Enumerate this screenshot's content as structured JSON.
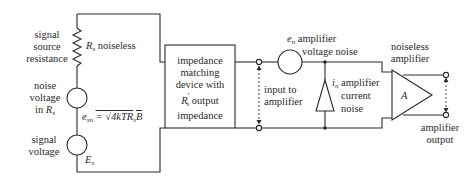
{
  "diagram": {
    "type": "circuit-schematic",
    "title": "",
    "labels": {
      "signal_source_resistance": [
        "signal",
        "source",
        "resistance"
      ],
      "rs_noiseless": "noiseless",
      "rs_symbol": "R",
      "rs_sub": "s",
      "noise_voltage": [
        "noise",
        "voltage",
        "in"
      ],
      "noise_voltage_rs": "R",
      "noise_voltage_rs_sub": "s",
      "esn_symbol": "e",
      "esn_sub": "sn",
      "esn_formula": "= √4kTR",
      "esn_formula_sub": "s",
      "esn_formula_tail": "B",
      "signal_voltage": [
        "signal",
        "voltage"
      ],
      "es_symbol": "E",
      "es_sub": "s",
      "impedance_box": [
        "impedance",
        "matching",
        "device with",
        "output",
        "impedance"
      ],
      "impedance_rs": "R",
      "impedance_rs_sub": "s",
      "impedance_rs_prime": "′",
      "input_to_amplifier": [
        "input to",
        "amplifier"
      ],
      "en_symbol": "e",
      "en_sub": "n",
      "en_label": [
        "amplifier",
        "voltage noise"
      ],
      "in_symbol": "i",
      "in_sub": "n",
      "in_label": [
        "amplifier",
        "current",
        "noise"
      ],
      "noiseless_amplifier": [
        "noiseless",
        "amplifier"
      ],
      "amp_gain": "A",
      "amplifier_output": [
        "amplifier",
        "output"
      ]
    },
    "components": [
      {
        "id": "Rs",
        "kind": "resistor",
        "note": "signal source resistance, noiseless"
      },
      {
        "id": "esn",
        "kind": "voltage-source",
        "note": "thermal noise voltage in Rs"
      },
      {
        "id": "Es",
        "kind": "voltage-source",
        "note": "signal voltage"
      },
      {
        "id": "matching",
        "kind": "block",
        "note": "impedance matching device with R's output impedance"
      },
      {
        "id": "en",
        "kind": "voltage-source",
        "note": "amplifier voltage noise"
      },
      {
        "id": "in",
        "kind": "current-source",
        "note": "amplifier current noise"
      },
      {
        "id": "A",
        "kind": "amplifier",
        "note": "noiseless amplifier"
      }
    ],
    "colors": {
      "line": "#2a2a2a",
      "background": "#ffffff"
    }
  }
}
